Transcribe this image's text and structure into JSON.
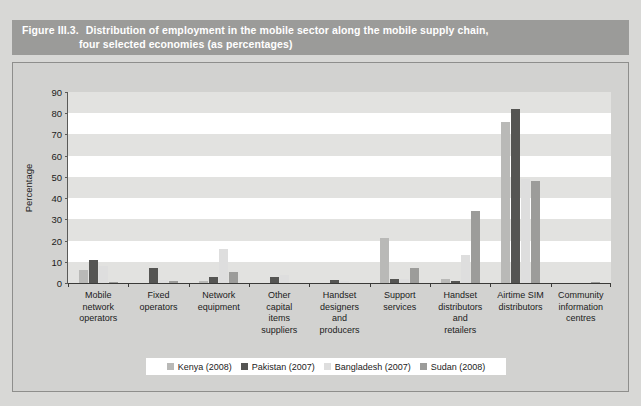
{
  "title": {
    "figure_number": "Figure III.3.",
    "line1": "Distribution of employment in the mobile sector along the mobile supply chain,",
    "line2": "four selected economies (as percentages)"
  },
  "colors": {
    "banner": "#9b9b99",
    "frame": "#d2d2d0",
    "plot_bg": "#ffffff",
    "band": "#e2e2e0",
    "series": [
      "#b9b9b7",
      "#555553",
      "#dedede",
      "#9c9c9a"
    ]
  },
  "chart_data": {
    "type": "bar",
    "title": "Distribution of employment in the mobile sector along the mobile supply chain, four selected economies (as percentages)",
    "xlabel": "",
    "ylabel": "Percentage",
    "ylim": [
      0,
      90
    ],
    "yticks": [
      0,
      10,
      20,
      30,
      40,
      50,
      60,
      70,
      80,
      90
    ],
    "grid": "horizontal-bands",
    "legend_position": "bottom",
    "categories": [
      "Mobile network operators",
      "Fixed operators",
      "Network equipment",
      "Other capital items suppliers",
      "Handset designers and producers",
      "Support services",
      "Handset distributors and retailers",
      "Airtime SIM distributors",
      "Community information centres"
    ],
    "category_lines": [
      [
        "Mobile",
        "network",
        "operators"
      ],
      [
        "Fixed",
        "operators"
      ],
      [
        "Network",
        "equipment"
      ],
      [
        "Other",
        "capital",
        "items",
        "suppliers"
      ],
      [
        "Handset",
        "designers",
        "and",
        "producers"
      ],
      [
        "Support",
        "services"
      ],
      [
        "Handset",
        "distributors",
        "and",
        "retailers"
      ],
      [
        "Airtime SIM",
        "distributors"
      ],
      [
        "Community",
        "information",
        "centres"
      ]
    ],
    "series": [
      {
        "name": "Kenya (2008)",
        "color": "#b9b9b7",
        "values": [
          6,
          0,
          1,
          0,
          0,
          21,
          2,
          76,
          0
        ]
      },
      {
        "name": "Pakistan (2007)",
        "color": "#555553",
        "values": [
          11,
          7,
          3,
          3,
          1.5,
          2,
          1,
          82,
          0
        ]
      },
      {
        "name": "Bangladesh (2007)",
        "color": "#dedede",
        "values": [
          8,
          1.5,
          16,
          4,
          1,
          2,
          13,
          49,
          0
        ]
      },
      {
        "name": "Sudan (2008)",
        "color": "#9c9c9a",
        "values": [
          0.5,
          1,
          5,
          0,
          0,
          7,
          34,
          48,
          0.5
        ]
      }
    ]
  },
  "legend": {
    "items": [
      {
        "label": "Kenya (2008)",
        "color": "#b9b9b7"
      },
      {
        "label": "Pakistan (2007)",
        "color": "#555553"
      },
      {
        "label": "Bangladesh (2007)",
        "color": "#dedede"
      },
      {
        "label": "Sudan (2008)",
        "color": "#9c9c9a"
      }
    ]
  }
}
